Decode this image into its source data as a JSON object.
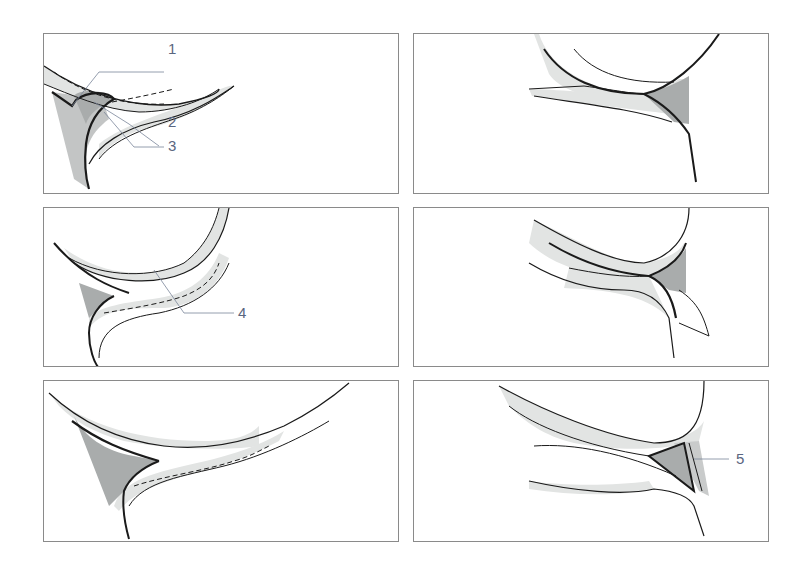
{
  "figure": {
    "layout": "3 rows x 2 columns of panels",
    "colors": {
      "outline": "#1a1a1a",
      "light_fill": "#e2e4e3",
      "dark_fill": "#a9acac",
      "label": "#5a6680",
      "leader": "#7a8599",
      "border": "#8a8a8a"
    },
    "panels": [
      {
        "id": "panel-1",
        "labels": [
          {
            "text": "1"
          },
          {
            "text": "2"
          },
          {
            "text": "3"
          }
        ]
      },
      {
        "id": "panel-2",
        "labels": []
      },
      {
        "id": "panel-3",
        "labels": [
          {
            "text": "4"
          }
        ]
      },
      {
        "id": "panel-4",
        "labels": []
      },
      {
        "id": "panel-5",
        "labels": []
      },
      {
        "id": "panel-6",
        "labels": [
          {
            "text": "5"
          }
        ]
      }
    ]
  }
}
